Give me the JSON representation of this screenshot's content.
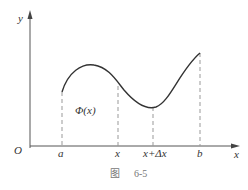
{
  "figure": {
    "caption_prefix": "图",
    "caption_number": "6-5",
    "axes": {
      "x_label": "x",
      "y_label": "y",
      "origin_label": "O"
    },
    "ticks": [
      {
        "label": "a",
        "x": 62
      },
      {
        "label": "x",
        "x": 118
      },
      {
        "label": "x+Δx",
        "x": 153
      },
      {
        "label": "b",
        "x": 200
      }
    ],
    "area_label": "Φ(x)",
    "colors": {
      "curve": "#333333",
      "axis": "#555555",
      "dashed": "#999999",
      "caption": "#777777"
    }
  }
}
